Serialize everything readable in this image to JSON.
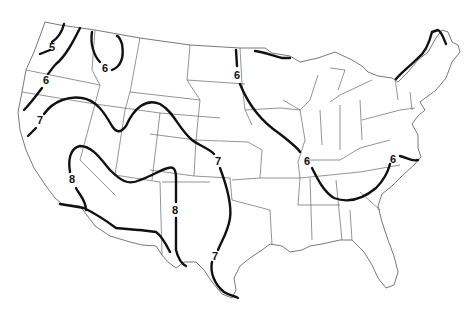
{
  "map": {
    "subject": "Contiguous United States with isolines",
    "outline_color": "#555555",
    "isoline_color": "#111111",
    "background": "#ffffff",
    "isolines": [
      {
        "id": "iso-5-pacific-nw",
        "value": "5",
        "label": "5",
        "label_pos": [
          52,
          47
        ]
      },
      {
        "id": "iso-6-west-coast",
        "value": "6",
        "label": "6",
        "label_pos": [
          46,
          80
        ]
      },
      {
        "id": "iso-6-idaho",
        "value": "6",
        "label": "6",
        "label_pos": [
          104,
          68
        ]
      },
      {
        "id": "iso-7-west",
        "value": "7",
        "label": "7",
        "label_pos": [
          40,
          120
        ]
      },
      {
        "id": "iso-7-plains-north",
        "value": "7",
        "label": "7",
        "label_pos": [
          218,
          161
        ]
      },
      {
        "id": "iso-7-plains-south",
        "value": "7",
        "label": "7",
        "label_pos": [
          215,
          256
        ]
      },
      {
        "id": "iso-8-california",
        "value": "8",
        "label": "8",
        "label_pos": [
          72,
          179
        ]
      },
      {
        "id": "iso-8-new-mexico",
        "value": "8",
        "label": "8",
        "label_pos": [
          175,
          210
        ]
      },
      {
        "id": "iso-6-central",
        "value": "6",
        "label": "6",
        "label_pos": [
          237,
          75
        ]
      },
      {
        "id": "iso-6-midwest",
        "value": "6",
        "label": "6",
        "label_pos": [
          307,
          161
        ]
      },
      {
        "id": "iso-6-east",
        "value": "6",
        "label": "6",
        "label_pos": [
          392,
          159
        ]
      }
    ]
  }
}
